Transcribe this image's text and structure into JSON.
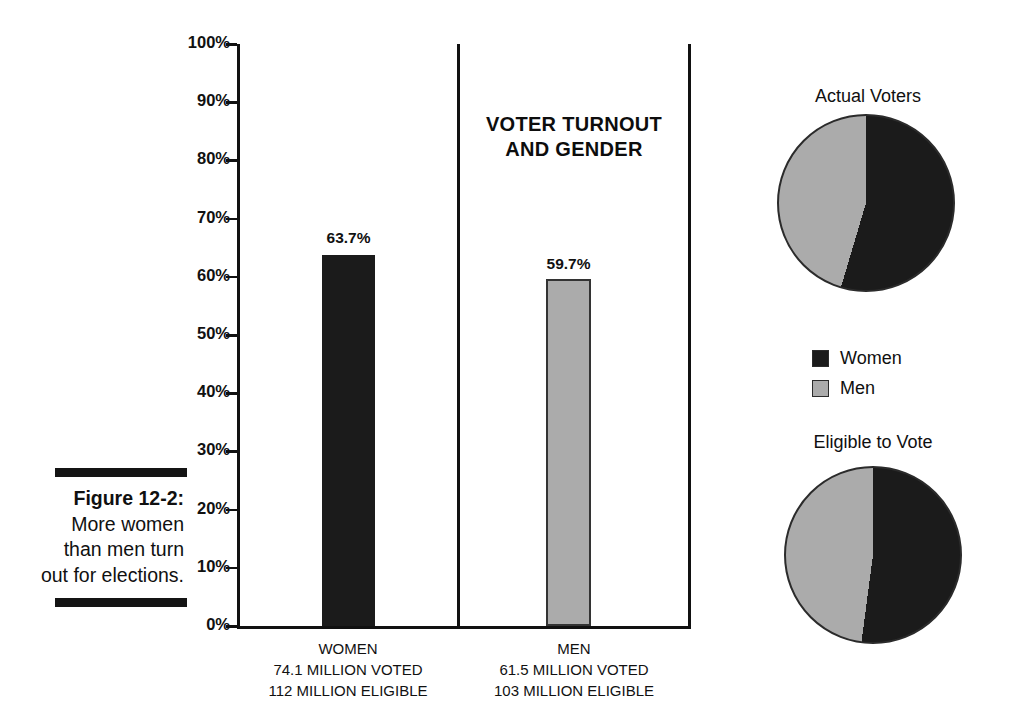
{
  "caption": {
    "label": "Figure 12-2:",
    "text": "More women than men turn out for elections."
  },
  "colors": {
    "women": "#1b1b1b",
    "men": "#ababab",
    "outline": "#2b2b2b"
  },
  "chart_data": [
    {
      "type": "bar",
      "title": "VOTER TURNOUT AND GENDER",
      "title_lines": [
        "VOTER TURNOUT",
        "AND GENDER"
      ],
      "categories": [
        "WOMEN",
        "MEN"
      ],
      "values": [
        63.7,
        59.7
      ],
      "value_labels": [
        "63.7%",
        "59.7%"
      ],
      "category_details": [
        {
          "name": "WOMEN",
          "voted": "74.1 MILLION VOTED",
          "eligible": "112 MILLION ELIGIBLE"
        },
        {
          "name": "MEN",
          "voted": "61.5 MILLION VOTED",
          "eligible": "103 MILLION ELIGIBLE"
        }
      ],
      "xlabel": "",
      "ylabel": "",
      "ylim": [
        0,
        100
      ],
      "yticks": [
        0,
        10,
        20,
        30,
        40,
        50,
        60,
        70,
        80,
        90,
        100
      ],
      "ytick_labels": [
        "0%",
        "10%",
        "20%",
        "30%",
        "40%",
        "50%",
        "60%",
        "70%",
        "80%",
        "90%",
        "100%"
      ],
      "grid": false,
      "legend_position": "none",
      "series": [
        {
          "name": "Women",
          "values": [
            63.7
          ],
          "color": "#1b1b1b"
        },
        {
          "name": "Men",
          "values": [
            59.7
          ],
          "color": "#ababab"
        }
      ]
    },
    {
      "type": "pie",
      "title": "Actual Voters",
      "labels": [
        "Women",
        "Men"
      ],
      "values": [
        74.1,
        61.5
      ],
      "percentages": [
        54.6,
        45.4
      ],
      "colors": [
        "#1b1b1b",
        "#ababab"
      ],
      "legend_position": "below",
      "start_angle_deg": 0,
      "direction": "clockwise"
    },
    {
      "type": "pie",
      "title": "Eligible to Vote",
      "labels": [
        "Women",
        "Men"
      ],
      "values": [
        112,
        103
      ],
      "percentages": [
        52.1,
        47.9
      ],
      "colors": [
        "#1b1b1b",
        "#ababab"
      ],
      "legend_position": "above",
      "start_angle_deg": 0,
      "direction": "clockwise"
    }
  ],
  "legend": {
    "items": [
      {
        "label": "Women",
        "color": "#1b1b1b"
      },
      {
        "label": "Men",
        "color": "#ababab"
      }
    ]
  }
}
